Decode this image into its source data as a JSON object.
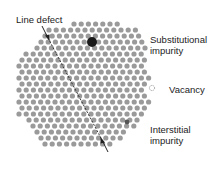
{
  "figure": {
    "lattice": {
      "atom_color": "#9a9a9a",
      "atom_radius": 2.6,
      "spacing_x": 7.2,
      "spacing_y": 6.2,
      "rows": [
        {
          "y": 24,
          "x_start": 74,
          "count": 7
        },
        {
          "y": 30,
          "x_start": 49,
          "count": 13
        },
        {
          "y": 36,
          "x_start": 45,
          "count": 14
        },
        {
          "y": 42,
          "x_start": 41,
          "count": 15
        },
        {
          "y": 48,
          "x_start": 37,
          "count": 16
        },
        {
          "y": 54,
          "x_start": 26,
          "count": 17
        },
        {
          "y": 60,
          "x_start": 22,
          "count": 18
        },
        {
          "y": 66,
          "x_start": 19,
          "count": 18
        },
        {
          "y": 72,
          "x_start": 22,
          "count": 18
        },
        {
          "y": 78,
          "x_start": 19,
          "count": 19
        },
        {
          "y": 84,
          "x_start": 22,
          "count": 18
        },
        {
          "y": 90,
          "x_start": 19,
          "count": 19
        },
        {
          "y": 96,
          "x_start": 22,
          "count": 18
        },
        {
          "y": 102,
          "x_start": 19,
          "count": 19
        },
        {
          "y": 108,
          "x_start": 22,
          "count": 18
        },
        {
          "y": 114,
          "x_start": 19,
          "count": 18
        },
        {
          "y": 120,
          "x_start": 29,
          "count": 16
        },
        {
          "y": 126,
          "x_start": 33,
          "count": 15
        },
        {
          "y": 132,
          "x_start": 37,
          "count": 13
        },
        {
          "y": 138,
          "x_start": 41,
          "count": 12
        },
        {
          "y": 144,
          "x_start": 45,
          "count": 10
        }
      ]
    },
    "defects": {
      "substitutional": {
        "x": 92,
        "y": 42,
        "r": 5,
        "color": "#1a1a1a"
      },
      "vacancy": {
        "x": 152,
        "y": 88,
        "r": 2.6,
        "stroke": "#888888"
      },
      "interstitial": {
        "x": 127,
        "y": 122,
        "r": 2.4,
        "color": "#555555"
      }
    },
    "line_defect": {
      "color": "#222222",
      "from": {
        "x": 42,
        "y": 26
      },
      "to": {
        "x": 108,
        "y": 152
      }
    },
    "labels": {
      "line_defect": "Line defect",
      "substitutional_line1": "Substitutional",
      "substitutional_line2": "impurity",
      "vacancy": "Vacancy",
      "interstitial_line1": "Interstitial",
      "interstitial_line2": "impurity"
    }
  }
}
